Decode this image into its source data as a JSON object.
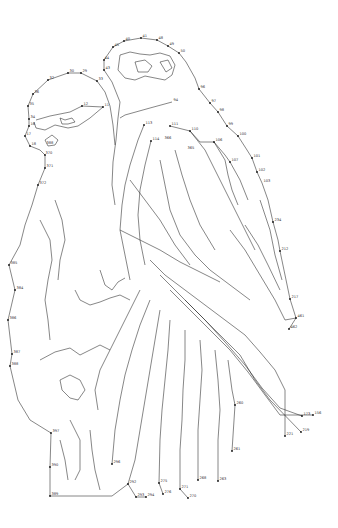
{
  "image": {
    "description": "Dot-to-dot connect-the-numbers line drawing of two birds perched side by side",
    "background": "#ffffff",
    "line_color": "#222222"
  },
  "labels": [
    {
      "t": "41",
      "x": 141,
      "y": 38
    },
    {
      "t": "40",
      "x": 124,
      "y": 41
    },
    {
      "t": "48",
      "x": 157,
      "y": 40
    },
    {
      "t": "49",
      "x": 168,
      "y": 46
    },
    {
      "t": "50",
      "x": 179,
      "y": 53
    },
    {
      "t": "44",
      "x": 103,
      "y": 60
    },
    {
      "t": "43",
      "x": 104,
      "y": 70
    },
    {
      "t": "45",
      "x": 113,
      "y": 47
    },
    {
      "t": "30",
      "x": 68,
      "y": 73
    },
    {
      "t": "29",
      "x": 81,
      "y": 73
    },
    {
      "t": "32",
      "x": 48,
      "y": 80
    },
    {
      "t": "33",
      "x": 97,
      "y": 81
    },
    {
      "t": "36",
      "x": 33,
      "y": 94
    },
    {
      "t": "35",
      "x": 28,
      "y": 106
    },
    {
      "t": "11",
      "x": 103,
      "y": 107
    },
    {
      "t": "12",
      "x": 82,
      "y": 106
    },
    {
      "t": "34",
      "x": 29,
      "y": 119
    },
    {
      "t": "16",
      "x": 29,
      "y": 126
    },
    {
      "t": "17",
      "x": 25,
      "y": 136
    },
    {
      "t": "18",
      "x": 30,
      "y": 146
    },
    {
      "t": "388",
      "x": 45,
      "y": 145
    },
    {
      "t": "370",
      "x": 44,
      "y": 155
    },
    {
      "t": "371",
      "x": 45,
      "y": 168
    },
    {
      "t": "372",
      "x": 38,
      "y": 185
    },
    {
      "t": "365",
      "x": 186,
      "y": 150
    },
    {
      "t": "366",
      "x": 163,
      "y": 140
    },
    {
      "t": "94",
      "x": 172,
      "y": 102
    },
    {
      "t": "96",
      "x": 199,
      "y": 89
    },
    {
      "t": "97",
      "x": 210,
      "y": 103
    },
    {
      "t": "98",
      "x": 218,
      "y": 112
    },
    {
      "t": "99",
      "x": 227,
      "y": 126
    },
    {
      "t": "100",
      "x": 238,
      "y": 136
    },
    {
      "t": "101",
      "x": 252,
      "y": 158
    },
    {
      "t": "102",
      "x": 257,
      "y": 172
    },
    {
      "t": "103",
      "x": 262,
      "y": 183
    },
    {
      "t": "113",
      "x": 144,
      "y": 125
    },
    {
      "t": "114",
      "x": 151,
      "y": 141
    },
    {
      "t": "110",
      "x": 190,
      "y": 131
    },
    {
      "t": "111",
      "x": 170,
      "y": 126
    },
    {
      "t": "106",
      "x": 214,
      "y": 142
    },
    {
      "t": "107",
      "x": 230,
      "y": 162
    },
    {
      "t": "234",
      "x": 273,
      "y": 222
    },
    {
      "t": "212",
      "x": 280,
      "y": 251
    },
    {
      "t": "217",
      "x": 290,
      "y": 299
    },
    {
      "t": "461",
      "x": 296,
      "y": 318
    },
    {
      "t": "462",
      "x": 289,
      "y": 329
    },
    {
      "t": "384",
      "x": 15,
      "y": 290
    },
    {
      "t": "385",
      "x": 9,
      "y": 265
    },
    {
      "t": "386",
      "x": 8,
      "y": 320
    },
    {
      "t": "387",
      "x": 12,
      "y": 354
    },
    {
      "t": "388",
      "x": 10,
      "y": 366
    },
    {
      "t": "389",
      "x": 50,
      "y": 496
    },
    {
      "t": "390",
      "x": 50,
      "y": 467
    },
    {
      "t": "397",
      "x": 51,
      "y": 433
    },
    {
      "t": "296",
      "x": 112,
      "y": 464
    },
    {
      "t": "294",
      "x": 146,
      "y": 497
    },
    {
      "t": "293",
      "x": 136,
      "y": 497
    },
    {
      "t": "292",
      "x": 128,
      "y": 484
    },
    {
      "t": "275",
      "x": 159,
      "y": 483
    },
    {
      "t": "276",
      "x": 163,
      "y": 494
    },
    {
      "t": "270",
      "x": 188,
      "y": 498
    },
    {
      "t": "271",
      "x": 180,
      "y": 489
    },
    {
      "t": "268",
      "x": 198,
      "y": 480
    },
    {
      "t": "263",
      "x": 218,
      "y": 481
    },
    {
      "t": "261",
      "x": 232,
      "y": 451
    },
    {
      "t": "260",
      "x": 235,
      "y": 405
    },
    {
      "t": "221",
      "x": 285,
      "y": 436
    },
    {
      "t": "219",
      "x": 301,
      "y": 432
    },
    {
      "t": "156",
      "x": 313,
      "y": 415
    },
    {
      "t": "173",
      "x": 302,
      "y": 416
    }
  ],
  "dots": [
    [
      141,
      38
    ],
    [
      124,
      41
    ],
    [
      157,
      40
    ],
    [
      168,
      46
    ],
    [
      179,
      53
    ],
    [
      113,
      47
    ],
    [
      104,
      60
    ],
    [
      104,
      70
    ],
    [
      68,
      73
    ],
    [
      81,
      73
    ],
    [
      48,
      80
    ],
    [
      97,
      81
    ],
    [
      33,
      94
    ],
    [
      28,
      106
    ],
    [
      103,
      107
    ],
    [
      82,
      106
    ],
    [
      29,
      119
    ],
    [
      29,
      126
    ],
    [
      25,
      136
    ],
    [
      30,
      146
    ],
    [
      45,
      155
    ],
    [
      45,
      168
    ],
    [
      38,
      185
    ],
    [
      199,
      89
    ],
    [
      210,
      103
    ],
    [
      218,
      112
    ],
    [
      227,
      126
    ],
    [
      238,
      136
    ],
    [
      252,
      158
    ],
    [
      257,
      172
    ],
    [
      144,
      125
    ],
    [
      151,
      141
    ],
    [
      190,
      131
    ],
    [
      170,
      126
    ],
    [
      214,
      142
    ],
    [
      230,
      162
    ],
    [
      273,
      222
    ],
    [
      280,
      251
    ],
    [
      290,
      299
    ],
    [
      296,
      318
    ],
    [
      289,
      329
    ],
    [
      15,
      290
    ],
    [
      9,
      265
    ],
    [
      8,
      320
    ],
    [
      12,
      354
    ],
    [
      10,
      366
    ],
    [
      50,
      496
    ],
    [
      50,
      467
    ],
    [
      51,
      433
    ],
    [
      112,
      464
    ],
    [
      146,
      497
    ],
    [
      136,
      497
    ],
    [
      128,
      484
    ],
    [
      159,
      483
    ],
    [
      163,
      494
    ],
    [
      188,
      498
    ],
    [
      180,
      489
    ],
    [
      198,
      480
    ],
    [
      218,
      481
    ],
    [
      232,
      451
    ],
    [
      235,
      405
    ],
    [
      285,
      436
    ],
    [
      301,
      432
    ],
    [
      313,
      415
    ],
    [
      302,
      416
    ]
  ],
  "paths": [
    "M104,70 L104,60 L113,47 L124,41 L141,38 L157,40 L168,46 L179,53 L186,62 L195,78 L199,89 L210,103 L218,112 L227,126 L238,136 L247,150 L252,158 L257,172 L262,183 L268,200 L273,222 L278,240 L280,251 L285,275 L290,299 L296,318 L289,329",
    "M104,70 L112,82 L120,102 L118,118 L116,140 L113,162 L112,185 L115,205",
    "M97,81 L81,73 L68,73 L48,80 L33,94 L28,106 L29,119 L29,126 L25,136 L30,146 L40,150 L45,155 L45,168 L38,185 L32,205 L25,225 L20,245 L9,265 L15,290 L8,320 L12,354 L10,366 L18,400 L30,420 L51,433 L50,467 L50,496 L112,496 L128,484 L136,497 L146,497",
    "M97,81 L105,92 L110,106 L113,125 L115,145",
    "M36,120 L50,116 L70,112 L82,106 L103,107 L90,118 L78,126 L68,128 L55,125 L45,130 L36,128 L34,122",
    "M60,118 L65,120 L72,118 L75,122 L68,124 L62,124 Z",
    "M45,140 L52,135 L58,140 L55,145 L48,146 Z",
    "M120,55 L130,52 L140,54 L150,55 L160,53 L170,56 L175,65 L172,75 L165,80 L155,78 L145,76 L135,80 L125,78 L118,70 Z",
    "M135,62 L145,60 L152,66 L148,72 L138,72 Z",
    "M160,62 L168,60 L172,68 L166,72 Z",
    "M172,102 L150,108 L125,115 L120,118",
    "M144,125 L138,140 L130,165 L125,185 L122,205 L120,230 L125,255 L130,280",
    "M151,141 L145,165 L140,190 L138,215 L140,240 L145,265",
    "M170,126 L190,131 L200,142 L214,142 L225,155 L230,162 L240,180 L248,200",
    "M190,131 L205,150 L215,170 L225,190 L235,210 L245,230 L255,250",
    "M214,142 L225,160 L228,175 L232,190 L238,205",
    "M160,160 L165,185 L170,210 L180,235 L195,255 L210,270 L230,285 L250,300",
    "M175,150 L182,175 L190,200 L200,225 L215,250",
    "M130,180 L145,200 L160,220 L175,245 L190,265",
    "M120,230 L140,240 L160,250 L180,262 L200,272 L220,282",
    "M150,260 L165,275 L185,290 L205,305 L225,320 L245,335 L260,352 L275,370 L285,390 L285,436",
    "M160,275 L180,295 L200,315 L220,335 L240,355 L255,380 L270,400 L301,432",
    "M170,290 L190,310 L210,330 L230,350 L248,372 L265,395 L280,415 L313,415",
    "M185,300 L205,320 L225,342 L245,365 L262,388 L280,408 L302,416",
    "M230,230 L245,250 L260,275 L275,300 L285,320 L296,318",
    "M245,225 L258,245 L268,265 L280,290",
    "M260,200 L270,230 L275,255 L282,280",
    "M140,290 L130,310 L120,330 L110,350 L100,370 L95,390 L98,410",
    "M150,300 L140,325 L132,350 L125,375 L120,400 L115,430 L112,464",
    "M160,310 L155,340 L150,370 L145,400 L140,430 L135,460 L128,484",
    "M170,320 L168,350 L165,380 L162,410 L160,440 L159,483 L163,494",
    "M185,330 L185,360 L183,390 L182,420 L180,450 L180,489 L188,498",
    "M200,340 L202,370 L200,400 L198,430 L198,480",
    "M215,350 L218,380 L220,410 L218,440 L218,481",
    "M228,360 L232,390 L235,405 L232,451",
    "M40,220 L50,240 L52,260 L48,280 L45,300 L48,320 L50,340",
    "M55,200 L62,220 L65,240 L60,260 L58,280",
    "M75,290 L80,300 L90,305 L100,302 L110,298 L120,295 L130,300",
    "M100,270 L105,285 L112,290 L118,282 L125,278",
    "M40,360 L55,352 L70,348 L80,355 L90,350 L100,345 L110,350",
    "M60,380 L70,375 L80,380 L85,390 L78,400 L70,398 L62,390 Z",
    "M70,420 L80,440 L80,470 L75,480",
    "M90,430 L92,450 L95,470 L100,490",
    "M60,440 L65,460 L68,480"
  ]
}
